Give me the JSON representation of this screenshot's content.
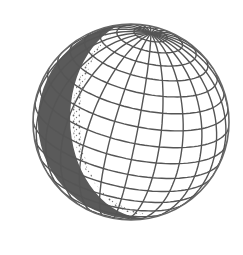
{
  "illustration": {
    "subject": "globe-wireframe",
    "line_color": "#555555",
    "shade_color": "#5a5a5a",
    "background": "#ffffff",
    "center": [
      131,
      122
    ],
    "radius": 98,
    "tilt_deg": 22,
    "rotation_deg": -55,
    "meridians": 24,
    "parallels_step_deg": 10
  }
}
